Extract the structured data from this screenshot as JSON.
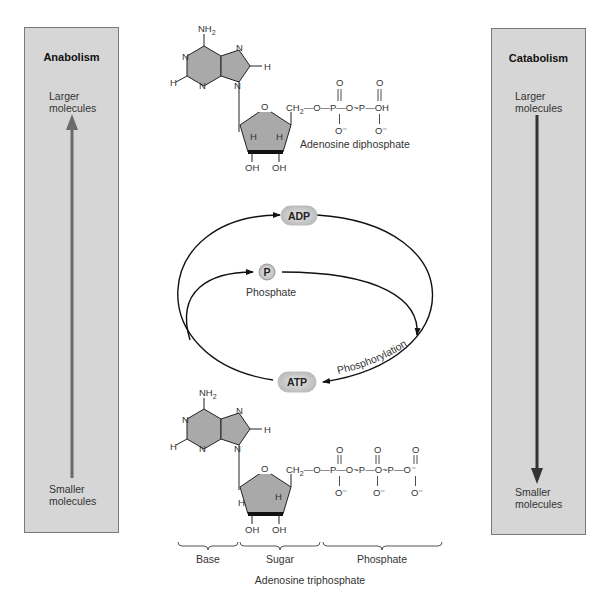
{
  "anabolism": {
    "title": "Anabolism",
    "top_label_1": "Larger",
    "top_label_2": "molecules",
    "bottom_label_1": "Smaller",
    "bottom_label_2": "molecules",
    "arrow_direction": "up",
    "arrow_color": "#6a6a6a"
  },
  "catabolism": {
    "title": "Catabolism",
    "top_label_1": "Larger",
    "top_label_2": "molecules",
    "bottom_label_1": "Smaller",
    "bottom_label_2": "molecules",
    "arrow_direction": "down",
    "arrow_color": "#333333"
  },
  "adp_molecule": {
    "name": "Adenosine diphosphate",
    "amine": "NH",
    "amine_sub": "2",
    "atoms": {
      "n": "N",
      "h": "H",
      "o": "O",
      "oh": "OH",
      "ch2": "CH",
      "ch2_sub": "2",
      "p": "P",
      "o_minus": "O⁻"
    },
    "phosphate_chain": "CH₂—O—P—O~P—OH"
  },
  "cycle": {
    "adp_label": "ADP",
    "atp_label": "ATP",
    "phosphate_symbol": "P",
    "phosphate_label": "Phosphate",
    "phosphorylation_label": "Phosphorylation",
    "pill_color": "#c8c8c8"
  },
  "atp_molecule": {
    "name": "Adenosine triphosphate",
    "amine": "NH",
    "amine_sub": "2",
    "phosphate_chain": "CH₂—O—P—O~P—O~P—O⁻",
    "segments": [
      "Base",
      "Sugar",
      "Phosphate"
    ]
  },
  "colors": {
    "box_fill": "#d6d6d6",
    "box_border": "#7a7a7a",
    "ring_fill": "#a9a9a9",
    "line": "#111111"
  }
}
